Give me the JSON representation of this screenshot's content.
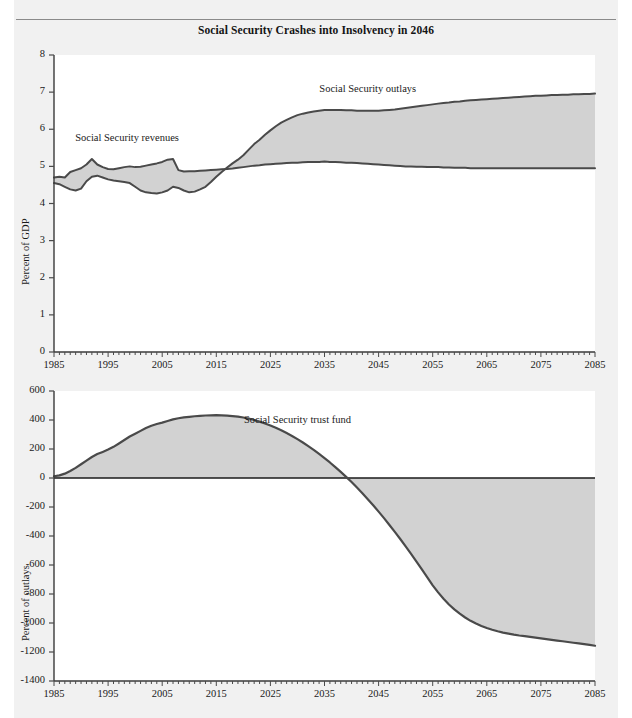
{
  "page": {
    "title": "Social Security Crashes into Insolvency in 2046",
    "background_color": "#f1f1f1",
    "plot_background_color": "#ffffff",
    "rule_color": "#8a8a8a"
  },
  "chart_data": [
    {
      "type": "area",
      "id": "top-panel",
      "title": "Social Security Crashes into Insolvency in 2046",
      "xlabel": "",
      "ylabel": "Percent of GDP",
      "xlim": [
        1985,
        2085
      ],
      "ylim": [
        0,
        8
      ],
      "ytick_labels": [
        "0",
        "1",
        "2",
        "3",
        "4",
        "5",
        "6",
        "7",
        "8"
      ],
      "ytick_values": [
        0,
        1,
        2,
        3,
        4,
        5,
        6,
        7,
        8
      ],
      "xtick_labels": [
        "1985",
        "1995",
        "2005",
        "2015",
        "2025",
        "2035",
        "2045",
        "2055",
        "2065",
        "2075",
        "2085"
      ],
      "xtick_values": [
        1985,
        1995,
        2005,
        2015,
        2025,
        2035,
        2045,
        2055,
        2065,
        2075,
        2085
      ],
      "minor_tick_interval": 1,
      "grid": false,
      "legend_position": "inline-annotation",
      "annotations": [
        {
          "text": "Social Security revenues",
          "x": 1998.5,
          "y": 5.75
        },
        {
          "text": "Social Security outlays",
          "x": 2043.0,
          "y": 7.05
        }
      ],
      "fill_color": "#d2d2d2",
      "line_color": "#4a4a4a",
      "x": [
        1985,
        1986,
        1987,
        1988,
        1989,
        1990,
        1991,
        1992,
        1993,
        1994,
        1995,
        1996,
        1997,
        1998,
        1999,
        2000,
        2001,
        2002,
        2003,
        2004,
        2005,
        2006,
        2007,
        2008,
        2009,
        2010,
        2011,
        2012,
        2013,
        2014,
        2015,
        2016,
        2017,
        2018,
        2019,
        2020,
        2021,
        2022,
        2023,
        2024,
        2025,
        2026,
        2027,
        2028,
        2029,
        2030,
        2031,
        2032,
        2033,
        2034,
        2035,
        2036,
        2037,
        2038,
        2039,
        2040,
        2041,
        2042,
        2043,
        2044,
        2045,
        2046,
        2047,
        2048,
        2049,
        2050,
        2051,
        2052,
        2053,
        2054,
        2055,
        2056,
        2057,
        2058,
        2059,
        2060,
        2061,
        2062,
        2063,
        2064,
        2065,
        2066,
        2067,
        2068,
        2069,
        2070,
        2071,
        2072,
        2073,
        2074,
        2075,
        2076,
        2077,
        2078,
        2079,
        2080,
        2081,
        2082,
        2083,
        2084,
        2085
      ],
      "series": [
        {
          "name": "Social Security revenues",
          "values": [
            4.7,
            4.72,
            4.7,
            4.85,
            4.9,
            4.95,
            5.05,
            5.2,
            5.05,
            4.98,
            4.93,
            4.92,
            4.95,
            4.98,
            5.0,
            4.98,
            4.99,
            5.02,
            5.05,
            5.08,
            5.12,
            5.18,
            5.2,
            4.9,
            4.86,
            4.87,
            4.87,
            4.88,
            4.89,
            4.9,
            4.91,
            4.92,
            4.93,
            4.94,
            4.96,
            4.98,
            5.0,
            5.02,
            5.03,
            5.05,
            5.06,
            5.07,
            5.08,
            5.09,
            5.1,
            5.1,
            5.11,
            5.12,
            5.12,
            5.12,
            5.13,
            5.12,
            5.12,
            5.11,
            5.1,
            5.1,
            5.09,
            5.08,
            5.07,
            5.06,
            5.05,
            5.04,
            5.03,
            5.02,
            5.01,
            5.0,
            5.0,
            4.99,
            4.99,
            4.98,
            4.98,
            4.98,
            4.97,
            4.97,
            4.96,
            4.96,
            4.96,
            4.95,
            4.95,
            4.95,
            4.95,
            4.95,
            4.95,
            4.95,
            4.95,
            4.95,
            4.95,
            4.95,
            4.95,
            4.95,
            4.95,
            4.95,
            4.95,
            4.95,
            4.95,
            4.95,
            4.95,
            4.95,
            4.95,
            4.95,
            4.95
          ]
        },
        {
          "name": "Social Security outlays",
          "values": [
            4.55,
            4.52,
            4.45,
            4.38,
            4.35,
            4.4,
            4.6,
            4.72,
            4.75,
            4.7,
            4.65,
            4.62,
            4.6,
            4.58,
            4.55,
            4.45,
            4.35,
            4.3,
            4.28,
            4.27,
            4.3,
            4.35,
            4.45,
            4.42,
            4.35,
            4.3,
            4.32,
            4.38,
            4.45,
            4.58,
            4.72,
            4.85,
            4.97,
            5.08,
            5.18,
            5.3,
            5.45,
            5.6,
            5.72,
            5.85,
            5.97,
            6.08,
            6.18,
            6.25,
            6.32,
            6.38,
            6.42,
            6.45,
            6.48,
            6.5,
            6.52,
            6.52,
            6.52,
            6.52,
            6.51,
            6.51,
            6.5,
            6.5,
            6.5,
            6.5,
            6.5,
            6.51,
            6.52,
            6.53,
            6.55,
            6.57,
            6.59,
            6.61,
            6.63,
            6.65,
            6.67,
            6.69,
            6.71,
            6.72,
            6.74,
            6.75,
            6.77,
            6.78,
            6.79,
            6.8,
            6.81,
            6.82,
            6.83,
            6.84,
            6.85,
            6.86,
            6.87,
            6.88,
            6.89,
            6.9,
            6.9,
            6.91,
            6.92,
            6.92,
            6.93,
            6.93,
            6.94,
            6.94,
            6.95,
            6.95,
            6.96
          ]
        }
      ]
    },
    {
      "type": "area",
      "id": "bottom-panel",
      "title": "",
      "xlabel": "",
      "ylabel": "Percent of outlays",
      "xlim": [
        1985,
        2085
      ],
      "ylim": [
        -1400,
        600
      ],
      "ytick_labels": [
        "600",
        "400",
        "200",
        "0",
        "-200",
        "-400",
        "-600",
        "-800",
        "-1000",
        "-1200",
        "-1400"
      ],
      "ytick_values": [
        600,
        400,
        200,
        0,
        -200,
        -400,
        -600,
        -800,
        -1000,
        -1200,
        -1400
      ],
      "xtick_labels": [
        "1985",
        "1995",
        "2005",
        "2015",
        "2025",
        "2035",
        "2045",
        "2055",
        "2065",
        "2075",
        "2085"
      ],
      "xtick_values": [
        1985,
        1995,
        2005,
        2015,
        2025,
        2035,
        2045,
        2055,
        2065,
        2075,
        2085
      ],
      "minor_tick_interval": 1,
      "grid": false,
      "legend_position": "inline-annotation",
      "annotations": [
        {
          "text": "Social Security trust fund",
          "x": 2030.0,
          "y": 390
        }
      ],
      "fill_color": "#d2d2d2",
      "line_color": "#4a4a4a",
      "zero_line_color": "#1a1a1a",
      "x": [
        1985,
        1986,
        1987,
        1988,
        1989,
        1990,
        1991,
        1992,
        1993,
        1994,
        1995,
        1996,
        1997,
        1998,
        1999,
        2000,
        2001,
        2002,
        2003,
        2004,
        2005,
        2006,
        2007,
        2008,
        2009,
        2010,
        2011,
        2012,
        2013,
        2014,
        2015,
        2016,
        2017,
        2018,
        2019,
        2020,
        2021,
        2022,
        2023,
        2024,
        2025,
        2026,
        2027,
        2028,
        2029,
        2030,
        2031,
        2032,
        2033,
        2034,
        2035,
        2036,
        2037,
        2038,
        2039,
        2040,
        2041,
        2042,
        2043,
        2044,
        2045,
        2046,
        2047,
        2048,
        2049,
        2050,
        2051,
        2052,
        2053,
        2054,
        2055,
        2056,
        2057,
        2058,
        2059,
        2060,
        2061,
        2062,
        2063,
        2064,
        2065,
        2066,
        2067,
        2068,
        2069,
        2070,
        2071,
        2072,
        2073,
        2074,
        2075,
        2076,
        2077,
        2078,
        2079,
        2080,
        2081,
        2082,
        2083,
        2084,
        2085
      ],
      "series": [
        {
          "name": "Social Security trust fund",
          "values": [
            12,
            18,
            30,
            48,
            70,
            95,
            120,
            145,
            165,
            180,
            196,
            215,
            238,
            262,
            286,
            305,
            325,
            345,
            360,
            372,
            382,
            393,
            404,
            412,
            418,
            422,
            426,
            429,
            431,
            432,
            433,
            432,
            430,
            427,
            423,
            417,
            410,
            400,
            389,
            376,
            362,
            346,
            329,
            310,
            290,
            268,
            245,
            220,
            194,
            166,
            137,
            107,
            75,
            42,
            8,
            -28,
            -66,
            -105,
            -146,
            -188,
            -232,
            -277,
            -324,
            -372,
            -421,
            -472,
            -523,
            -576,
            -630,
            -685,
            -740,
            -789,
            -833,
            -872,
            -906,
            -936,
            -962,
            -985,
            -1004,
            -1021,
            -1035,
            -1047,
            -1057,
            -1066,
            -1073,
            -1080,
            -1086,
            -1091,
            -1096,
            -1101,
            -1106,
            -1111,
            -1116,
            -1121,
            -1126,
            -1131,
            -1136,
            -1141,
            -1146,
            -1151,
            -1157
          ]
        }
      ]
    }
  ]
}
